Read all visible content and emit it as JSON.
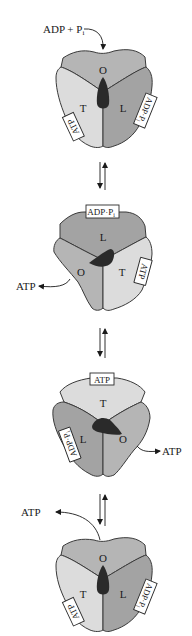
{
  "figure": {
    "type": "binding-change-mechanism",
    "colors": {
      "O": "#b5b5b5",
      "L": "#a3a3a3",
      "T": "#dcdcdc",
      "stalk": "#2a2a2a",
      "outline": "#3a3a3a",
      "background": "#ffffff"
    },
    "equilibrium_arrow": "⇅",
    "states": [
      {
        "index": 1,
        "subunits": {
          "top": "O",
          "left": "T",
          "right": "L"
        },
        "bound": {
          "left": "ATP",
          "right": "ADP·Pi"
        },
        "incoming": "ADP + Pi",
        "incoming_sub": "i"
      },
      {
        "index": 2,
        "subunits": {
          "top": "L",
          "left": "O",
          "right": "T"
        },
        "bound": {
          "top": "ADP·Pi",
          "right": "ATP"
        },
        "released": "ATP"
      },
      {
        "index": 3,
        "subunits": {
          "top": "T",
          "left": "L",
          "right": "O"
        },
        "bound": {
          "top": "ATP",
          "left": "ADP·Pi"
        },
        "released": "ATP"
      },
      {
        "index": 4,
        "subunits": {
          "top": "O",
          "left": "T",
          "right": "L"
        },
        "bound": {
          "left": "ATP",
          "right": "ADP·Pi"
        },
        "released": "ATP"
      }
    ],
    "labels": {
      "s1_in_main": "ADP + P",
      "s1_in_sub": "i",
      "s1_top": "O",
      "s1_left": "T",
      "s1_right": "L",
      "s1_tag_left": "ATP",
      "s1_tag_right": "ADP·P",
      "s2_top": "L",
      "s2_left": "O",
      "s2_right": "T",
      "s2_tag_top": "ADP·P",
      "s2_tag_right": "ATP",
      "s2_out": "ATP",
      "s3_top": "T",
      "s3_left": "L",
      "s3_right": "O",
      "s3_tag_top": "ATP",
      "s3_tag_left": "ADP·P",
      "s3_out": "ATP",
      "s4_top": "O",
      "s4_left": "T",
      "s4_right": "L",
      "s4_tag_left": "ATP",
      "s4_tag_right": "ADP·P",
      "s4_out": "ATP",
      "tag_sub": "i"
    }
  }
}
